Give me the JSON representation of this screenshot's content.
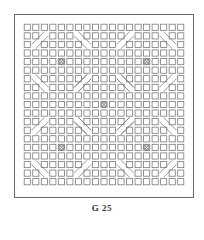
{
  "figure": {
    "caption": "G 25",
    "grid": {
      "rows": 19,
      "cols": 19
    },
    "medallion_centers": [
      [
        4,
        4
      ],
      [
        4,
        14
      ],
      [
        9,
        9
      ],
      [
        14,
        4
      ],
      [
        14,
        14
      ]
    ],
    "line_color": "#7a7a7a",
    "frame_color": "#6a6a6a"
  }
}
